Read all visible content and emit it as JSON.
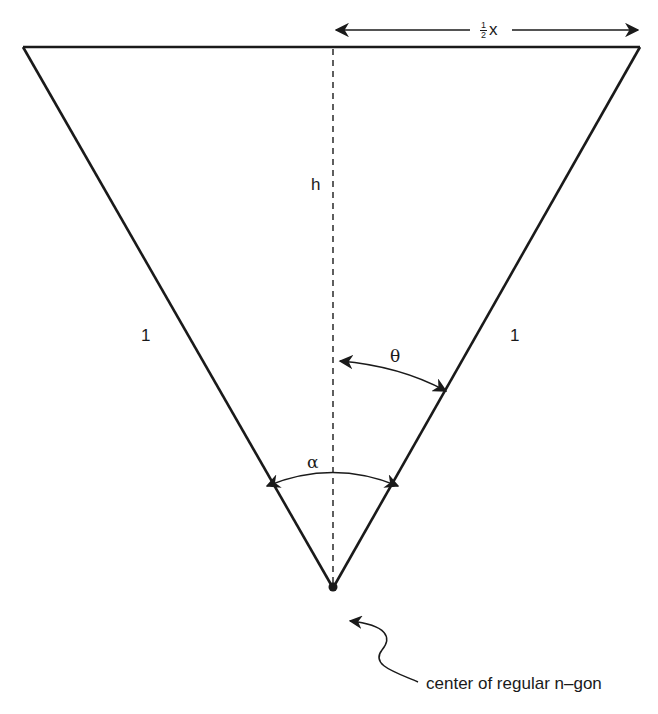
{
  "diagram": {
    "labels": {
      "half_x": {
        "numerator": "1",
        "denominator": "2",
        "variable": "x"
      },
      "height": "h",
      "left_side": "1",
      "right_side": "1",
      "theta": "θ",
      "alpha": "α",
      "center_annotation": "center of regular n–gon"
    },
    "colors": {
      "stroke": "#1a1a1a",
      "background": "#ffffff"
    },
    "geometry": {
      "top_left": [
        23,
        47
      ],
      "top_right": [
        640,
        47
      ],
      "apex": [
        333,
        588
      ],
      "dashed_altitude_x": 333
    }
  }
}
